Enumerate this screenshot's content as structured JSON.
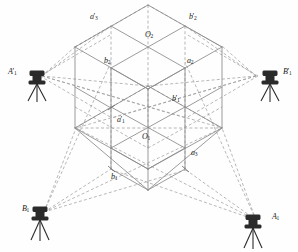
{
  "figure": {
    "background_color": "#fefefe",
    "solid_line_color": "#8a8a8a",
    "dashed_line_color": "#9a9a9a",
    "instrument_color": "#2b2b2b",
    "label_color": "#1a1a1a"
  },
  "labels": {
    "a3_prime": {
      "base": "a",
      "prime": "′",
      "sub": "3",
      "x": 90,
      "y": 13
    },
    "b2_prime": {
      "base": "b",
      "prime": "′",
      "sub": "2",
      "x": 189,
      "y": 13
    },
    "O2": {
      "base": "O",
      "prime": "",
      "sub": "2",
      "x": 145,
      "y": 31
    },
    "b2": {
      "base": "b",
      "prime": "",
      "sub": "2",
      "x": 104,
      "y": 57
    },
    "a2": {
      "base": "a",
      "prime": "",
      "sub": "2",
      "x": 187,
      "y": 57
    },
    "b1_prime": {
      "base": "b",
      "prime": "′",
      "sub": "1",
      "x": 172,
      "y": 95
    },
    "a1_prime": {
      "base": "a",
      "prime": "′",
      "sub": "1",
      "x": 117,
      "y": 116
    },
    "O1": {
      "base": "O",
      "prime": "",
      "sub": "1",
      "x": 142,
      "y": 133
    },
    "a3": {
      "base": "a",
      "prime": "",
      "sub": "3",
      "x": 191,
      "y": 149
    },
    "b1": {
      "base": "b",
      "prime": "",
      "sub": "1",
      "x": 111,
      "y": 173
    }
  },
  "instruments": [
    {
      "name": "A1_prime",
      "base": "A",
      "prime": "′",
      "sub": "1",
      "label_x": 8,
      "label_y": 68,
      "station_x": 35,
      "station_y": 78
    },
    {
      "name": "B1_prime",
      "base": "B",
      "prime": "′",
      "sub": "1",
      "label_x": 283,
      "label_y": 68,
      "station_x": 272,
      "station_y": 78
    },
    {
      "name": "B1",
      "base": "B",
      "prime": "",
      "sub": "1",
      "label_x": 22,
      "label_y": 205,
      "station_x": 38,
      "station_y": 215
    },
    {
      "name": "A1",
      "base": "A",
      "prime": "",
      "sub": "1",
      "label_x": 272,
      "label_y": 213,
      "station_x": 262,
      "station_y": 222
    }
  ],
  "geometry": {
    "description": "2x2x2 isometric cube grid, vertices projected isometrically",
    "cube_top_apex": {
      "x": 148,
      "y": 5
    },
    "cube_left_corner": {
      "x": 75,
      "y": 47
    },
    "cube_right_corner": {
      "x": 222,
      "y": 47
    },
    "cube_bottom_front": {
      "x": 148,
      "y": 190
    },
    "grid_divisions": 2
  }
}
